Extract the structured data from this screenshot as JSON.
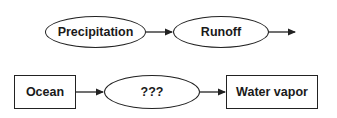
{
  "diagram": {
    "row1": {
      "nodes": [
        {
          "label": "Precipitation",
          "shape": "ellipse"
        },
        {
          "label": "Runoff",
          "shape": "ellipse"
        }
      ],
      "edges": [
        {
          "from": "Precipitation",
          "to": "Runoff"
        },
        {
          "from": "Runoff",
          "to": ""
        }
      ]
    },
    "row2": {
      "nodes": [
        {
          "label": "Ocean",
          "shape": "rectangle"
        },
        {
          "label": "???",
          "shape": "ellipse"
        },
        {
          "label": "Water vapor",
          "shape": "rectangle"
        }
      ],
      "edges": [
        {
          "from": "Ocean",
          "to": "???"
        },
        {
          "from": "???",
          "to": "Water vapor"
        }
      ]
    },
    "colors": {
      "stroke": "#222222",
      "text": "#1a1a1a",
      "background": "#ffffff"
    }
  }
}
